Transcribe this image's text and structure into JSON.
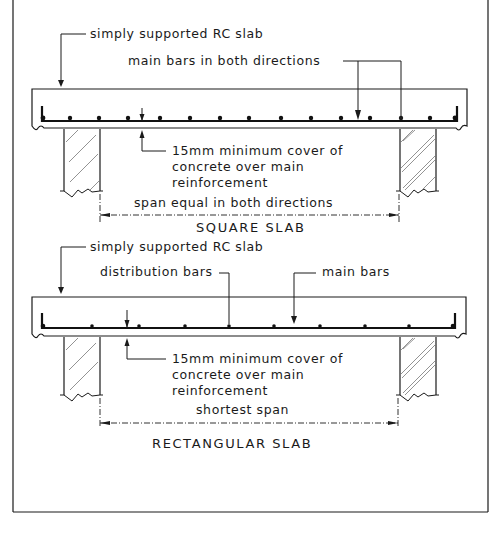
{
  "figure": {
    "frame": {
      "left": 13,
      "right": 488,
      "bottom": 512
    },
    "colors": {
      "ink": "#1a1a1a",
      "background": "#ffffff",
      "hatch": "#777777"
    }
  },
  "square_slab": {
    "caption": "SQUARE SLAB",
    "labels": {
      "slab": "simply supported RC slab",
      "bars": "main bars in both directions",
      "cover_line1": "15mm minimum cover of",
      "cover_line2": "concrete over main",
      "cover_line3": "reinforcement",
      "span": "span equal in both directions"
    },
    "bar_positions_x": [
      43,
      70,
      99,
      128,
      160,
      190,
      220,
      249,
      281,
      311,
      341,
      370,
      402,
      430,
      455
    ]
  },
  "rectangular_slab": {
    "caption": "RECTANGULAR SLAB",
    "labels": {
      "slab": "simply supported RC slab",
      "distribution_bars": "distribution bars",
      "main_bars": "main bars",
      "cover_line1": "15mm  minimum cover of",
      "cover_line2": "concrete  over main",
      "cover_line3": "reinforcement",
      "span": "shortest  span"
    },
    "bar_positions_x": [
      43,
      92,
      139,
      185,
      229,
      274,
      320,
      365,
      409,
      455
    ]
  }
}
